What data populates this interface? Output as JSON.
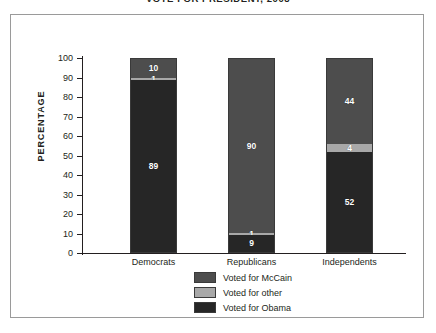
{
  "chart_data": {
    "type": "bar",
    "subtype": "stacked-percentage",
    "title": "VOTE FOR PRESIDENT, 2008",
    "xlabel": "",
    "ylabel": "PERCENTAGE",
    "ylim": [
      0,
      100
    ],
    "yticks": [
      100,
      90,
      80,
      70,
      60,
      50,
      40,
      30,
      20,
      10,
      0
    ],
    "grid": false,
    "legend_position": "bottom-center",
    "categories": [
      "Democrats",
      "Republicans",
      "Independents"
    ],
    "series": [
      {
        "name": "Voted for McCain",
        "color": "#4d4d4d",
        "values": [
          10,
          90,
          44
        ]
      },
      {
        "name": "Voted for other",
        "color": "#a8a8a8",
        "values": [
          1,
          1,
          4
        ]
      },
      {
        "name": "Voted for Obama",
        "color": "#262626",
        "values": [
          89,
          9,
          52
        ]
      }
    ],
    "bars": [
      {
        "category": "Democrats",
        "segments": [
          {
            "series": "Voted for McCain",
            "value": 10,
            "label": "10"
          },
          {
            "series": "Voted for other",
            "value": 1,
            "label": "1"
          },
          {
            "series": "Voted for Obama",
            "value": 89,
            "label": "89"
          }
        ]
      },
      {
        "category": "Republicans",
        "segments": [
          {
            "series": "Voted for McCain",
            "value": 90,
            "label": "90"
          },
          {
            "series": "Voted for other",
            "value": 1,
            "label": "1"
          },
          {
            "series": "Voted for Obama",
            "value": 9,
            "label": "9"
          }
        ]
      },
      {
        "category": "Independents",
        "segments": [
          {
            "series": "Voted for McCain",
            "value": 44,
            "label": "44"
          },
          {
            "series": "Voted for other",
            "value": 4,
            "label": "4"
          },
          {
            "series": "Voted for Obama",
            "value": 52,
            "label": "52"
          }
        ]
      }
    ]
  },
  "colors": {
    "mccain": "#4d4d4d",
    "other": "#a8a8a8",
    "obama": "#262626",
    "axis": "#231f20",
    "frame": "#9a9a9a",
    "background": "#ffffff"
  }
}
